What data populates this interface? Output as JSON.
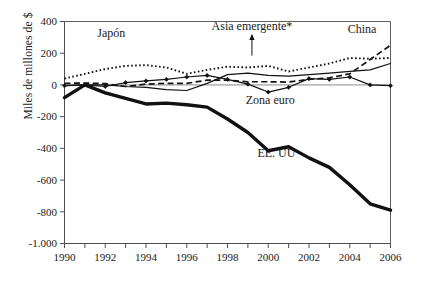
{
  "chart_data": {
    "type": "line",
    "title": "",
    "xlabel": "",
    "ylabel": "Miles de millones de $",
    "xlim": [
      1990,
      2006
    ],
    "ylim": [
      -1000,
      400
    ],
    "yticks": [
      400,
      200,
      0,
      -200,
      -400,
      -600,
      -800,
      -1000
    ],
    "ytick_labels": [
      "400",
      "200",
      "0",
      "-200",
      "-400",
      "-600",
      "-800",
      "-1.000"
    ],
    "xticks": [
      1990,
      1991,
      1992,
      1993,
      1994,
      1995,
      1996,
      1997,
      1998,
      1999,
      2000,
      2001,
      2002,
      2003,
      2004,
      2005,
      2006
    ],
    "xtick_labels_shown": [
      "1990",
      "1992",
      "1994",
      "1996",
      "1998",
      "2000",
      "2002",
      "2004",
      "2006"
    ],
    "grid": false,
    "legend": "inline-annotations",
    "x": [
      1990,
      1991,
      1992,
      1993,
      1994,
      1995,
      1996,
      1997,
      1998,
      1999,
      2000,
      2001,
      2002,
      2003,
      2004,
      2005,
      2006
    ],
    "series": [
      {
        "name": "Japón",
        "style": "dotted",
        "values": [
          40,
          70,
          100,
          120,
          125,
          110,
          70,
          95,
          115,
          110,
          120,
          85,
          110,
          135,
          170,
          165,
          170
        ]
      },
      {
        "name": "Asia emergente*",
        "style": "solid-thin",
        "values": [
          -5,
          0,
          0,
          -10,
          -15,
          -30,
          -35,
          10,
          65,
          75,
          60,
          55,
          65,
          75,
          85,
          95,
          135
        ]
      },
      {
        "name": "Zona euro",
        "style": "solid-thin-markers",
        "values": [
          -5,
          0,
          -10,
          15,
          25,
          35,
          50,
          60,
          35,
          5,
          -45,
          -15,
          40,
          35,
          50,
          0,
          -5
        ]
      },
      {
        "name": "China",
        "style": "dashed",
        "values": [
          10,
          12,
          8,
          -10,
          5,
          10,
          10,
          30,
          30,
          20,
          20,
          18,
          35,
          45,
          70,
          160,
          250
        ]
      },
      {
        "name": "EE. UU",
        "style": "solid-thick",
        "values": [
          -80,
          0,
          -50,
          -85,
          -120,
          -115,
          -125,
          -140,
          -215,
          -300,
          -415,
          -390,
          -460,
          -520,
          -630,
          -750,
          -790
        ]
      }
    ],
    "annotations": [
      {
        "text": "Japón",
        "x": 1992.3,
        "y": 300
      },
      {
        "text": "Asia emergente*",
        "x": 1999.2,
        "y": 345
      },
      {
        "text": "China",
        "x": 2004.6,
        "y": 330
      },
      {
        "text": "Zona euro",
        "x": 2000.1,
        "y": -120
      },
      {
        "text": "EE. UU",
        "x": 2000.4,
        "y": -455
      }
    ]
  },
  "axis": {
    "y_title": "Miles de millones de $"
  }
}
